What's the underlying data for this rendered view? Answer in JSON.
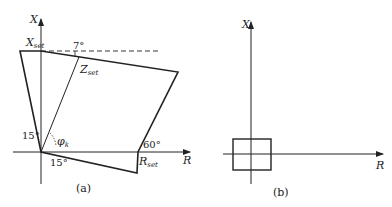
{
  "diagram_a": {
    "caption": "(a)",
    "axis_x_label": "X",
    "axis_r_label": "R",
    "x_set_label": "X",
    "x_set_sub": "set",
    "z_set_label": "Z",
    "z_set_sub": "set",
    "r_set_label": "R",
    "r_set_sub": "set",
    "angle_top": "7°",
    "angle_left": "15°",
    "angle_bottom": "15°",
    "angle_right": "60°",
    "phi_label": "φ",
    "phi_sub": "k"
  },
  "diagram_b": {
    "caption": "(b)",
    "axis_x_label": "X",
    "axis_r_label": "R"
  },
  "colors": {
    "line": "#222222",
    "background": "#ffffff"
  }
}
